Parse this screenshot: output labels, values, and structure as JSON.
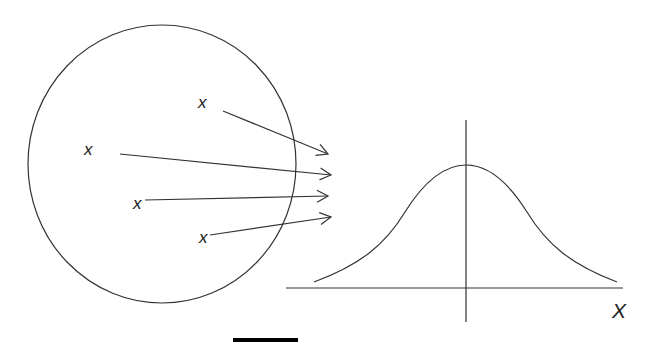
{
  "diagram": {
    "population": {
      "shape": "circle",
      "sample_labels": [
        "x",
        "x",
        "x",
        "x"
      ]
    },
    "distribution": {
      "shape": "bell-curve",
      "axis_label": "X"
    },
    "colors": {
      "line": "#333333",
      "background": "#ffffff",
      "bar": "#000000"
    }
  }
}
